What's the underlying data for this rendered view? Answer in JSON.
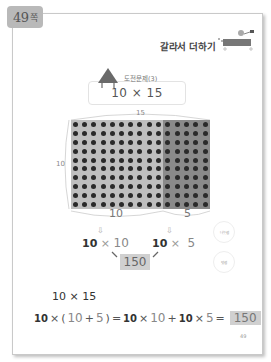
{
  "page_tab": {
    "number": "49",
    "unit": "쪽"
  },
  "header": {
    "title": "갈라서 더하기"
  },
  "challenge": {
    "label": "도전문제(3)",
    "expression": "10 × 15"
  },
  "grid": {
    "rows": 10,
    "cols_total": 15,
    "cols_left": 10,
    "cols_right": 5,
    "top_label": "15",
    "side_label": "10",
    "bottom_left_label": "10",
    "bottom_right_label": "5",
    "colors": {
      "left": "#bfbfbf",
      "right": "#8a8a8a",
      "dot": "#2a2a2a"
    }
  },
  "breakdown": {
    "left": {
      "a": "10",
      "op": "×",
      "b": "10"
    },
    "right": {
      "a": "10",
      "op": "×",
      "b": "5"
    },
    "result": "150",
    "hints": [
      "나눗셈",
      "덧셈"
    ]
  },
  "expression": {
    "title": "10 × 15",
    "parts": [
      "10",
      "×",
      "(",
      "10",
      "+",
      "5",
      ")",
      "=",
      "10",
      "×",
      "10",
      "+",
      "10",
      "×",
      "5",
      "="
    ],
    "result": "150"
  },
  "footer": {
    "page_number": "49"
  }
}
